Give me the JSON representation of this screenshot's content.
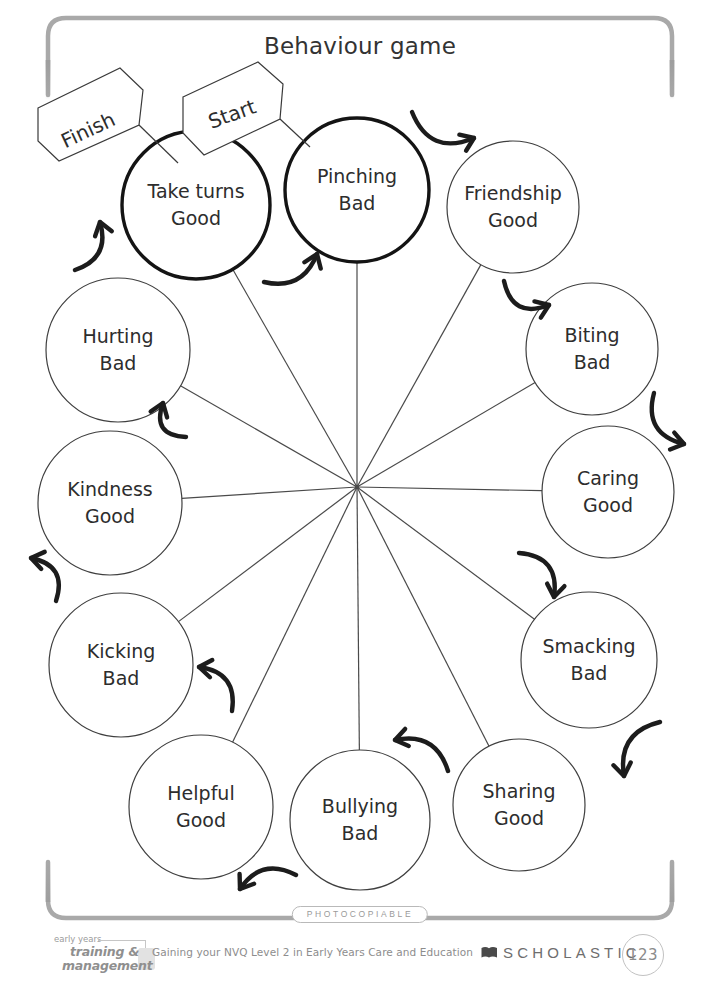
{
  "page": {
    "title": "Behaviour game",
    "width": 720,
    "height": 1006,
    "background": "#ffffff",
    "ink": "#2d2d2d",
    "frame_color": "#9e9e9e"
  },
  "flags": {
    "start": {
      "label": "Start",
      "x": 232,
      "y": 114,
      "rotation": -20
    },
    "finish": {
      "label": "Finish",
      "x": 88,
      "y": 130,
      "rotation": -25
    }
  },
  "wheel": {
    "hub": {
      "x": 357,
      "y": 487
    },
    "spoke_color": "#4a4a4a",
    "arrow_color": "#1c1c1c",
    "direction": "clockwise-from-start",
    "nodes": [
      {
        "id": "pinching",
        "line1": "Pinching",
        "line2": "Bad",
        "x": 357,
        "y": 190,
        "r": 72,
        "highlight": true,
        "kind": "bad"
      },
      {
        "id": "friendship",
        "line1": "Friendship",
        "line2": "Good",
        "x": 513,
        "y": 207,
        "r": 66,
        "highlight": false,
        "kind": "good"
      },
      {
        "id": "biting",
        "line1": "Biting",
        "line2": "Bad",
        "x": 592,
        "y": 349,
        "r": 66,
        "highlight": false,
        "kind": "bad"
      },
      {
        "id": "caring",
        "line1": "Caring",
        "line2": "Good",
        "x": 608,
        "y": 492,
        "r": 66,
        "highlight": false,
        "kind": "good"
      },
      {
        "id": "smacking",
        "line1": "Smacking",
        "line2": "Bad",
        "x": 589,
        "y": 660,
        "r": 68,
        "highlight": false,
        "kind": "bad"
      },
      {
        "id": "sharing",
        "line1": "Sharing",
        "line2": "Good",
        "x": 519,
        "y": 805,
        "r": 66,
        "highlight": false,
        "kind": "good"
      },
      {
        "id": "bullying",
        "line1": "Bullying",
        "line2": "Bad",
        "x": 360,
        "y": 820,
        "r": 70,
        "highlight": false,
        "kind": "bad"
      },
      {
        "id": "helpful",
        "line1": "Helpful",
        "line2": "Good",
        "x": 201,
        "y": 807,
        "r": 72,
        "highlight": false,
        "kind": "good"
      },
      {
        "id": "kicking",
        "line1": "Kicking",
        "line2": "Bad",
        "x": 121,
        "y": 665,
        "r": 72,
        "highlight": false,
        "kind": "bad"
      },
      {
        "id": "kindness",
        "line1": "Kindness",
        "line2": "Good",
        "x": 110,
        "y": 503,
        "r": 72,
        "highlight": false,
        "kind": "good"
      },
      {
        "id": "hurting",
        "line1": "Hurting",
        "line2": "Bad",
        "x": 118,
        "y": 350,
        "r": 72,
        "highlight": false,
        "kind": "bad"
      },
      {
        "id": "take-turns",
        "line1": "Take turns",
        "line2": "Good",
        "x": 196,
        "y": 205,
        "r": 74,
        "highlight": true,
        "kind": "good"
      }
    ],
    "arrows": [
      {
        "from": "pinching",
        "to": "friendship",
        "x1": 412,
        "y1": 112,
        "x2": 474,
        "y2": 138,
        "bow": 34
      },
      {
        "from": "friendship",
        "to": "biting",
        "x1": 504,
        "y1": 281,
        "x2": 549,
        "y2": 305,
        "bow": 30
      },
      {
        "from": "biting",
        "to": "caring",
        "x1": 654,
        "y1": 393,
        "x2": 684,
        "y2": 444,
        "bow": 30
      },
      {
        "from": "caring",
        "to": "smacking",
        "x1": 519,
        "y1": 553,
        "x2": 554,
        "y2": 597,
        "bow": -30
      },
      {
        "from": "smacking",
        "to": "sharing",
        "x1": 660,
        "y1": 722,
        "x2": 624,
        "y2": 776,
        "bow": 30
      },
      {
        "from": "sharing",
        "to": "bullying",
        "x1": 448,
        "y1": 771,
        "x2": 395,
        "y2": 740,
        "bow": 28
      },
      {
        "from": "bullying",
        "to": "helpful",
        "x1": 296,
        "y1": 875,
        "x2": 240,
        "y2": 889,
        "bow": 26
      },
      {
        "from": "helpful",
        "to": "kicking",
        "x1": 232,
        "y1": 711,
        "x2": 199,
        "y2": 667,
        "bow": 28
      },
      {
        "from": "kicking",
        "to": "kindness",
        "x1": 56,
        "y1": 601,
        "x2": 31,
        "y2": 558,
        "bow": 28
      },
      {
        "from": "kindness",
        "to": "hurting",
        "x1": 186,
        "y1": 437,
        "x2": 163,
        "y2": 403,
        "bow": -28
      },
      {
        "from": "hurting",
        "to": "take-turns",
        "x1": 75,
        "y1": 270,
        "x2": 100,
        "y2": 222,
        "bow": 26
      },
      {
        "from": "take-turns",
        "to": "pinching",
        "x1": 264,
        "y1": 282,
        "x2": 317,
        "y2": 254,
        "bow": 26
      }
    ]
  },
  "footer": {
    "photocopiable": "PHOTOCOPIABLE",
    "logo": {
      "line_top": "early years",
      "line_bold_1": "training &",
      "line_bold_2": "management"
    },
    "book_title": "Gaining your NVQ Level 2 in Early Years Care and Education",
    "publisher": "SCHOLASTIC",
    "page_number": "123"
  }
}
